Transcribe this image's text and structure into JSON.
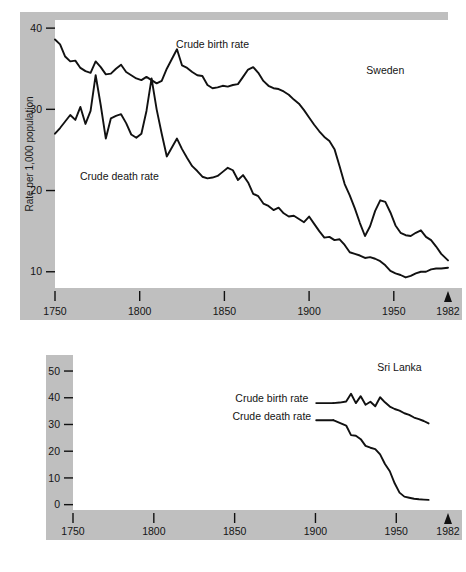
{
  "figure": {
    "background_color": "#ffffff",
    "band_color": "#bfbfbf",
    "line_color": "#111111",
    "panels": [
      "sweden",
      "sri_lanka"
    ]
  },
  "chart_data": [
    {
      "type": "line",
      "id": "sweden",
      "title": "Sweden",
      "xlabel": "",
      "ylabel": "Rate per 1,000 population",
      "xlim": [
        1750,
        1982
      ],
      "ylim": [
        8,
        41
      ],
      "grid": false,
      "legend": "inline-annotations",
      "xticks": [
        1750,
        1800,
        1850,
        1900,
        1950,
        1982
      ],
      "xtick_labels": [
        "1750",
        "1800",
        "1850",
        "1900",
        "1950",
        "1982"
      ],
      "yticks": [
        10,
        20,
        30,
        40
      ],
      "ytick_labels": [
        "10",
        "20",
        "30",
        "40"
      ],
      "annotations": [
        {
          "text": "Crude birth rate",
          "x": 1843,
          "y": 37.6
        },
        {
          "text": "Crude death rate",
          "x": 1788,
          "y": 21.3
        },
        {
          "text": "Sweden",
          "x": 1945,
          "y": 34.3
        }
      ],
      "end_marker": {
        "shape": "triangle-up",
        "x": 1982,
        "label": "1982"
      },
      "series": [
        {
          "name": "Crude birth rate",
          "x": [
            1750,
            1753,
            1756,
            1759,
            1762,
            1765,
            1768,
            1771,
            1774,
            1777,
            1780,
            1783,
            1786,
            1789,
            1792,
            1795,
            1798,
            1801,
            1804,
            1807,
            1810,
            1813,
            1816,
            1819,
            1822,
            1825,
            1828,
            1831,
            1834,
            1837,
            1840,
            1843,
            1846,
            1849,
            1852,
            1855,
            1858,
            1861,
            1864,
            1867,
            1870,
            1873,
            1876,
            1879,
            1882,
            1885,
            1888,
            1891,
            1894,
            1897,
            1900,
            1903,
            1906,
            1909,
            1912,
            1915,
            1918,
            1921,
            1924,
            1927,
            1930,
            1933,
            1936,
            1939,
            1942,
            1945,
            1948,
            1951,
            1954,
            1957,
            1960,
            1963,
            1966,
            1969,
            1972,
            1975,
            1978,
            1982
          ],
          "y": [
            38.6,
            38.0,
            36.5,
            35.9,
            36.0,
            35.1,
            34.7,
            34.5,
            35.9,
            35.2,
            34.3,
            34.4,
            35.0,
            35.5,
            34.6,
            34.2,
            33.8,
            33.6,
            34.0,
            33.6,
            33.2,
            33.5,
            35.0,
            36.2,
            37.4,
            35.4,
            35.1,
            34.6,
            34.2,
            34.1,
            33.0,
            32.6,
            32.7,
            32.9,
            32.8,
            33.0,
            33.1,
            34.0,
            34.9,
            35.2,
            34.5,
            33.5,
            32.9,
            32.6,
            32.5,
            32.2,
            31.8,
            31.2,
            30.7,
            29.9,
            29.0,
            28.1,
            27.3,
            26.6,
            26.1,
            25.1,
            23.0,
            20.8,
            19.4,
            17.8,
            16.0,
            14.4,
            15.6,
            17.5,
            18.8,
            18.6,
            17.3,
            15.7,
            14.8,
            14.5,
            14.4,
            14.8,
            15.1,
            14.3,
            13.9,
            13.1,
            12.2,
            11.4
          ]
        },
        {
          "name": "Crude death rate",
          "x": [
            1750,
            1753,
            1756,
            1759,
            1762,
            1765,
            1768,
            1771,
            1774,
            1777,
            1780,
            1783,
            1786,
            1789,
            1792,
            1795,
            1798,
            1801,
            1804,
            1807,
            1810,
            1813,
            1816,
            1819,
            1822,
            1825,
            1828,
            1831,
            1834,
            1837,
            1840,
            1843,
            1846,
            1849,
            1852,
            1855,
            1858,
            1861,
            1864,
            1867,
            1870,
            1873,
            1876,
            1879,
            1882,
            1885,
            1888,
            1891,
            1894,
            1897,
            1900,
            1903,
            1906,
            1909,
            1912,
            1915,
            1918,
            1921,
            1924,
            1927,
            1930,
            1933,
            1936,
            1939,
            1942,
            1945,
            1948,
            1951,
            1954,
            1957,
            1960,
            1963,
            1966,
            1969,
            1972,
            1975,
            1978,
            1982
          ],
          "y": [
            27.0,
            27.7,
            28.5,
            29.3,
            28.7,
            30.3,
            28.2,
            29.8,
            34.2,
            30.5,
            26.4,
            28.9,
            29.2,
            29.4,
            28.3,
            26.9,
            26.5,
            27.0,
            29.8,
            33.8,
            30.0,
            27.0,
            24.2,
            25.3,
            26.4,
            25.1,
            24.0,
            23.0,
            22.4,
            21.7,
            21.5,
            21.6,
            21.8,
            22.3,
            22.8,
            22.5,
            21.3,
            21.9,
            21.0,
            19.6,
            19.3,
            18.4,
            18.1,
            17.6,
            17.9,
            17.2,
            16.8,
            16.9,
            16.5,
            16.1,
            16.8,
            15.9,
            15.0,
            14.2,
            14.3,
            13.9,
            14.0,
            13.3,
            12.4,
            12.2,
            12.0,
            11.7,
            11.8,
            11.6,
            11.3,
            10.8,
            10.1,
            9.8,
            9.6,
            9.3,
            9.5,
            9.8,
            10.0,
            10.0,
            10.3,
            10.4,
            10.4,
            10.5
          ]
        }
      ]
    },
    {
      "type": "line",
      "id": "sri_lanka",
      "title": "Sri Lanka",
      "xlabel": "",
      "ylabel": "",
      "xlim": [
        1750,
        1982
      ],
      "ylim": [
        -2,
        56
      ],
      "grid": false,
      "legend": "inline-annotations",
      "xticks": [
        1750,
        1800,
        1850,
        1900,
        1950,
        1982
      ],
      "xtick_labels": [
        "1750",
        "1800",
        "1850",
        "1900",
        "1950",
        "1982"
      ],
      "yticks": [
        0,
        10,
        20,
        30,
        40,
        50
      ],
      "ytick_labels": [
        "0",
        "10",
        "20",
        "30",
        "40",
        "50"
      ],
      "annotations": [
        {
          "text": "Crude birth rate",
          "x": 1873,
          "y": 38.5
        },
        {
          "text": "Crude death rate",
          "x": 1873,
          "y": 31.5
        },
        {
          "text": "Sri Lanka",
          "x": 1952,
          "y": 50.0
        }
      ],
      "end_marker": {
        "shape": "triangle-up",
        "x": 1982,
        "label": "1982"
      },
      "series": [
        {
          "name": "Crude birth rate",
          "x": [
            1911,
            1915,
            1919,
            1922,
            1925,
            1928,
            1931,
            1934,
            1937,
            1940,
            1943,
            1946,
            1949,
            1952,
            1955,
            1958,
            1961,
            1964,
            1967,
            1970
          ],
          "y": [
            38.0,
            38.2,
            38.6,
            41.5,
            38.0,
            40.6,
            37.4,
            38.5,
            36.8,
            40.2,
            38.3,
            36.7,
            35.8,
            35.2,
            34.2,
            33.6,
            32.6,
            32.0,
            31.3,
            30.4
          ]
        },
        {
          "name": "Crude death rate",
          "x": [
            1911,
            1915,
            1919,
            1922,
            1925,
            1928,
            1931,
            1934,
            1937,
            1940,
            1943,
            1946,
            1949,
            1952,
            1955,
            1958,
            1961,
            1964,
            1967,
            1970
          ],
          "y": [
            31.6,
            30.6,
            29.6,
            26.0,
            25.8,
            24.5,
            22.0,
            21.3,
            20.8,
            18.8,
            15.2,
            12.5,
            8.0,
            4.5,
            3.0,
            2.6,
            2.2,
            2.0,
            1.9,
            1.8
          ]
        }
      ]
    }
  ]
}
